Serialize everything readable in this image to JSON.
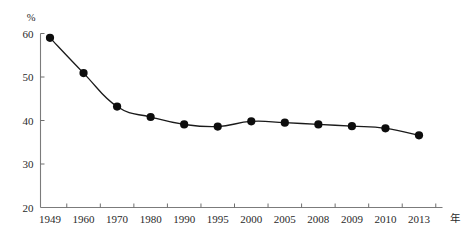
{
  "chart_data": {
    "type": "line",
    "title": "",
    "xlabel": "年",
    "ylabel": "%",
    "categories": [
      "1949",
      "1960",
      "1970",
      "1980",
      "1990",
      "1995",
      "2000",
      "2005",
      "2008",
      "2009",
      "2010",
      "2013"
    ],
    "values": [
      59.0,
      50.9,
      43.2,
      40.8,
      39.1,
      38.6,
      39.8,
      39.5,
      39.1,
      38.7,
      38.2,
      36.6
    ],
    "series": [
      {
        "name": "",
        "values": [
          59.0,
          50.9,
          43.2,
          40.8,
          39.1,
          38.6,
          39.8,
          39.5,
          39.1,
          38.7,
          38.2,
          36.6
        ]
      }
    ],
    "ylim": [
      20,
      60
    ],
    "yticks": [
      20,
      30,
      40,
      50,
      60
    ],
    "ytick_labels": [
      "20",
      "30",
      "40",
      "50",
      "60"
    ],
    "xtick_labels": [
      "1949",
      "1960",
      "1970",
      "1980",
      "1990",
      "1995",
      "2000",
      "2005",
      "2008",
      "2009",
      "2010",
      "2013"
    ],
    "grid": false,
    "legend": false,
    "legend_position": "none",
    "marker": "filled-circle",
    "line_color": "#1a1a1a",
    "marker_color": "#0d0d0d",
    "axis_color": "#7b7b7b",
    "background_color": "#ffffff"
  },
  "axes": {
    "y_unit_label": "%",
    "x_unit_label": "年"
  }
}
